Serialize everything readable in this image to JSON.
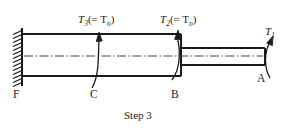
{
  "figure": {
    "caption": "Step 3",
    "background_color": "#ffffff",
    "line_color": "#1a1a1a"
  },
  "torque_labels": [
    {
      "id": "T3",
      "symbol": "T",
      "subscript": "3",
      "equals_text": "(= T",
      "equals_subscript": "o",
      "close_paren": ")",
      "full_text": "T3(= To)"
    },
    {
      "id": "T2",
      "symbol": "T",
      "subscript": "2",
      "equals_text": "(= T",
      "equals_subscript": "o",
      "close_paren": ")",
      "full_text": "T2(= To)"
    },
    {
      "id": "T1",
      "symbol": "T",
      "subscript": "1",
      "equals_text": "",
      "equals_subscript": "",
      "close_paren": "",
      "full_text": "T1"
    }
  ],
  "point_labels": [
    {
      "id": "F",
      "text": "F"
    },
    {
      "id": "C",
      "text": "C"
    },
    {
      "id": "B",
      "text": "B"
    },
    {
      "id": "A",
      "text": "A"
    }
  ],
  "geometry": {
    "wall_x": 22,
    "large_shaft": {
      "x1": 22,
      "x2": 181,
      "top": 34,
      "bottom": 76
    },
    "small_shaft": {
      "x1": 181,
      "x2": 265,
      "top": 48,
      "bottom": 65
    },
    "centerline_y": 56,
    "torque_marks_x": {
      "C": 97,
      "B": 178,
      "A": 267
    }
  }
}
